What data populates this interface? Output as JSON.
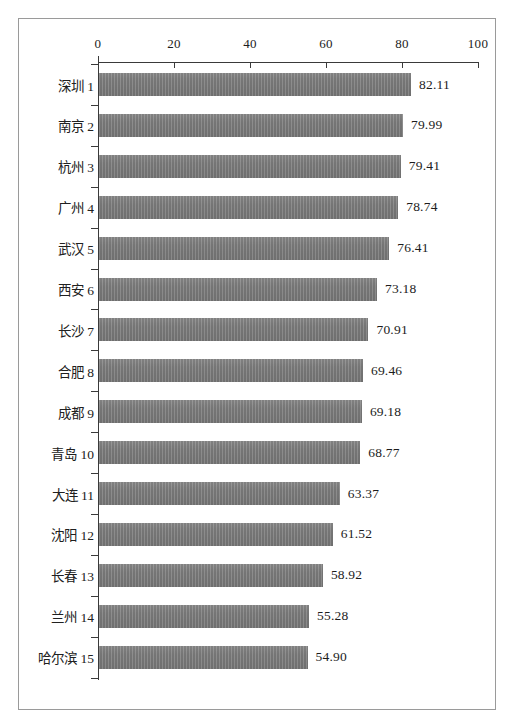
{
  "chart_data": {
    "type": "bar",
    "orientation": "horizontal",
    "title": "",
    "subtitle": "",
    "xlabel": "",
    "ylabel": "",
    "xlim": [
      0,
      100
    ],
    "xticks": [
      0,
      20,
      40,
      60,
      80,
      100
    ],
    "xtick_labels": [
      "0",
      "20",
      "40",
      "60",
      "80",
      "100"
    ],
    "axis_position": "top",
    "grid": false,
    "legend": null,
    "bar_color": "#7c7c7c",
    "categories": [
      "深圳 1",
      "南京 2",
      "杭州 3",
      "广州 4",
      "武汉 5",
      "西安 6",
      "长沙 7",
      "合肥 8",
      "成都 9",
      "青岛 10",
      "大连 11",
      "沈阳 12",
      "长春 13",
      "兰州 14",
      "哈尔滨 15"
    ],
    "values": [
      82.11,
      79.99,
      79.41,
      78.74,
      76.41,
      73.18,
      70.91,
      69.46,
      69.18,
      68.77,
      63.37,
      61.52,
      58.92,
      55.28,
      54.9
    ],
    "value_labels": [
      "82.11",
      "79.99",
      "79.41",
      "78.74",
      "76.41",
      "73.18",
      "70.91",
      "69.46",
      "69.18",
      "68.77",
      "63.37",
      "61.52",
      "58.92",
      "55.28",
      "54.90"
    ]
  }
}
